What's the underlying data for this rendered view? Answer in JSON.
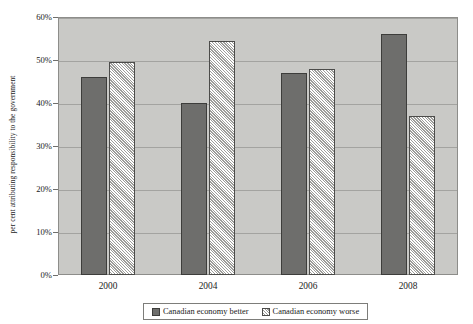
{
  "chart_data": {
    "type": "bar",
    "title": "",
    "xlabel": "",
    "ylabel": "per cent attributing responsibility to the government",
    "categories": [
      "2000",
      "2004",
      "2006",
      "2008"
    ],
    "series": [
      {
        "name": "Canadian economy better",
        "values": [
          46,
          40,
          47,
          56
        ],
        "swatch": "solid-dark-gray",
        "color": "#6e6e6c"
      },
      {
        "name": "Canadian economy worse",
        "values": [
          49.5,
          54.5,
          48,
          37
        ],
        "swatch": "diagonal-hatch",
        "color": "#f2f2f0"
      }
    ],
    "ylim": [
      0,
      60
    ],
    "ytick_values": [
      0,
      10,
      20,
      30,
      40,
      50,
      60
    ],
    "ytick_labels": [
      "0%",
      "10%",
      "20%",
      "30%",
      "40%",
      "50%",
      "60%"
    ],
    "grid": true,
    "legend_position": "bottom-center",
    "plot_background_color": "#c9c9c6",
    "gridline_color": "#a3a3a0",
    "figure_background_color": "#ffffff"
  },
  "legend": {
    "entries": [
      {
        "label": "Canadian economy better"
      },
      {
        "label": "Canadian economy worse"
      }
    ]
  }
}
